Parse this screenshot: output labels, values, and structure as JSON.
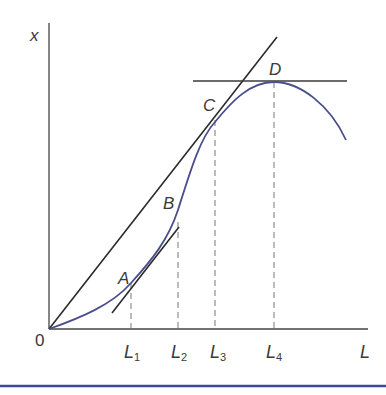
{
  "diagram": {
    "y_axis_label": "x",
    "x_axis_label": "L",
    "origin_label": "0",
    "points": [
      {
        "label": "A"
      },
      {
        "label": "B"
      },
      {
        "label": "C"
      },
      {
        "label": "D"
      }
    ],
    "ticks": [
      {
        "base": "L",
        "sub": "1"
      },
      {
        "base": "L",
        "sub": "2"
      },
      {
        "base": "L",
        "sub": "3"
      },
      {
        "base": "L",
        "sub": "4"
      }
    ],
    "colors": {
      "curve": "#4a4e8c",
      "lines": "#2a2a2a",
      "dashed": "#777777",
      "rule": "#3c4a9a"
    }
  }
}
